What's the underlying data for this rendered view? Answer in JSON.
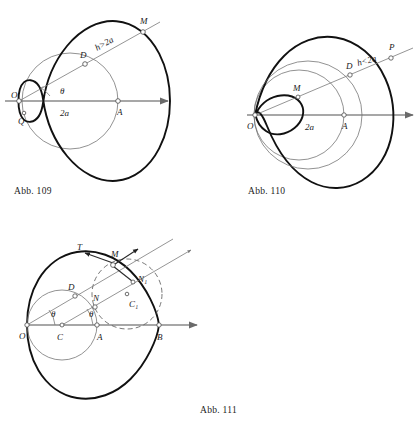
{
  "page": {
    "width": 416,
    "height": 427,
    "background": "#ffffff",
    "ink": "#111111",
    "thin_ink": "#6d6d6d",
    "axis_color": "#8a8a8a"
  },
  "figures": [
    {
      "id": "abb-109",
      "caption": "Abb. 109",
      "kind": "limacon",
      "condition_label": "h>2a",
      "description": "Pascal limacon without loop, h greater than 2a, dimpled at pole O",
      "diameter_label": "2a",
      "angle_label": "θ",
      "points": [
        {
          "name": "O",
          "label": "O",
          "role": "pole"
        },
        {
          "name": "Q",
          "label": "Q",
          "role": "dimple-point"
        },
        {
          "name": "A",
          "label": "A",
          "role": "circle-far-point"
        },
        {
          "name": "D",
          "label": "D",
          "role": "ray-circle-intersection"
        },
        {
          "name": "M",
          "label": "M",
          "role": "curve-point"
        }
      ]
    },
    {
      "id": "abb-110",
      "caption": "Abb. 110",
      "kind": "limacon",
      "condition_label": "h<2a",
      "description": "Pascal limacon with inner loop, h less than 2a",
      "diameter_label": "2a",
      "points": [
        {
          "name": "O",
          "label": "O",
          "role": "pole"
        },
        {
          "name": "M",
          "label": "M",
          "role": "inner-loop-point"
        },
        {
          "name": "A",
          "label": "A",
          "role": "circle-far-point"
        },
        {
          "name": "D",
          "label": "D",
          "role": "ray-circle-intersection"
        },
        {
          "name": "P",
          "label": "P",
          "role": "curve-point"
        }
      ]
    },
    {
      "id": "abb-111",
      "caption": "Abb. 111",
      "kind": "cardioid",
      "description": "Cardioid with cusp at O, generating circle centre C, rolling circle centre C1 dashed, tangent T and normal at M",
      "angle_label_1": "θ",
      "angle_label_2": "θ",
      "points": [
        {
          "name": "O",
          "label": "O",
          "role": "cusp-pole"
        },
        {
          "name": "C",
          "label": "C",
          "role": "base-circle-centre"
        },
        {
          "name": "A",
          "label": "A",
          "role": "base-circle-far-point"
        },
        {
          "name": "B",
          "label": "B",
          "role": "cardioid-vertex"
        },
        {
          "name": "D",
          "label": "D",
          "role": "ray-base-circle-intersection"
        },
        {
          "name": "N",
          "label": "N",
          "role": "normal-foot"
        },
        {
          "name": "N1",
          "label": "N₁",
          "role": "second-normal-point"
        },
        {
          "name": "M",
          "label": "M",
          "role": "curve-point"
        },
        {
          "name": "T",
          "label": "T",
          "role": "tangent-direction"
        },
        {
          "name": "C1",
          "label": "C₁",
          "role": "rolling-circle-centre"
        }
      ]
    }
  ]
}
